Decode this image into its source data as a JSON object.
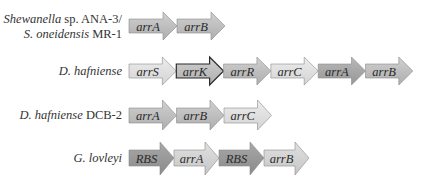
{
  "figure": {
    "type": "gene-cluster-diagram",
    "colors": {
      "lightest": "#e0e0e0",
      "light": "#d2d2d2",
      "medium": "#bdbdbd",
      "dark": "#a4a4a4",
      "darkest": "#959595",
      "outline": "#8a8a8a",
      "outline_strong": "#2b2b2b"
    },
    "rows": [
      {
        "label_italic": "Shewanella",
        "label_rest": " sp. ANA-3/",
        "label2_italic": "S. oneidensis",
        "label2_rest": " MR-1",
        "genes": [
          {
            "name": "arrA",
            "shade": "medium"
          },
          {
            "name": "arrB",
            "shade": "medium"
          }
        ]
      },
      {
        "label_italic": "D. hafniense",
        "label_rest": "",
        "genes": [
          {
            "name": "arrS",
            "shade": "lightest"
          },
          {
            "name": "arrK",
            "shade": "medium",
            "highlight": true
          },
          {
            "name": "arrR",
            "shade": "medium"
          },
          {
            "name": "arrC",
            "shade": "lightest"
          },
          {
            "name": "arrA",
            "shade": "dark"
          },
          {
            "name": "arrB",
            "shade": "medium"
          }
        ]
      },
      {
        "label_italic": "D. hafniense",
        "label_rest": " DCB-2",
        "genes": [
          {
            "name": "arrA",
            "shade": "medium"
          },
          {
            "name": "arrB",
            "shade": "medium"
          },
          {
            "name": "arrC",
            "shade": "lightest"
          }
        ]
      },
      {
        "label_italic": "G. lovleyi",
        "label_rest": "",
        "genes": [
          {
            "name": "RBS",
            "shade": "darkest"
          },
          {
            "name": "arrA",
            "shade": "light"
          },
          {
            "name": "RBS",
            "shade": "darkest"
          },
          {
            "name": "arrB",
            "shade": "light"
          }
        ]
      }
    ]
  }
}
